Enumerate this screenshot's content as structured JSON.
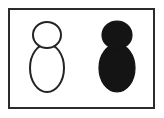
{
  "figure": {
    "background_color": "#ffffff",
    "frame": {
      "name": "rectangular-border",
      "color": "#2b2b2b",
      "thickness_px": 2,
      "x": 8,
      "y": 8,
      "width": 147,
      "height": 101
    },
    "shapes": [
      {
        "id": "left-figure",
        "label": "Outlined figure",
        "style": "outline",
        "stroke_color": "#242424",
        "fill_color": "#ffffff",
        "stroke_width_px": 2,
        "head": {
          "cx": 37,
          "cy": 25,
          "rx": 14,
          "ry": 13
        },
        "body": {
          "cx": 37,
          "cy": 58,
          "rx": 17,
          "ry": 24
        }
      },
      {
        "id": "right-figure",
        "label": "Filled figure",
        "style": "filled",
        "stroke_color": "#141414",
        "fill_color": "#141414",
        "stroke_width_px": 1,
        "head": {
          "cx": 107,
          "cy": 25,
          "rx": 15,
          "ry": 14
        },
        "body": {
          "cx": 107,
          "cy": 58,
          "rx": 18,
          "ry": 24
        }
      }
    ],
    "caption": ""
  }
}
